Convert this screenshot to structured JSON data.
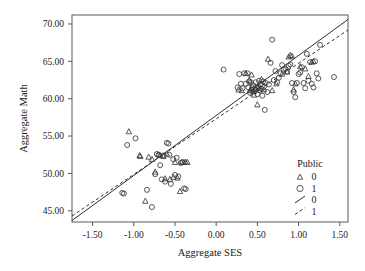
{
  "chart_data": {
    "type": "scatter",
    "title": "",
    "xlabel": "Aggregate SES",
    "ylabel": "Aggregate Math",
    "xlim": [
      -1.75,
      1.6
    ],
    "ylim": [
      43.5,
      71.2
    ],
    "xticks": [
      "-1.50",
      "-1.00",
      "-0.50",
      "0.00",
      "0.50",
      "1.00",
      "1.50"
    ],
    "xtick_values": [
      -1.5,
      -1.0,
      -0.5,
      0.0,
      0.5,
      1.0,
      1.5
    ],
    "yticks": [
      "45.00",
      "50.00",
      "55.00",
      "60.00",
      "65.00",
      "70.00"
    ],
    "ytick_values": [
      45,
      50,
      55,
      60,
      65,
      70
    ],
    "grid": false,
    "legend": {
      "title": "Public",
      "position": "inside-bottom-right",
      "entries": [
        {
          "marker": "triangle",
          "label": "0"
        },
        {
          "marker": "circle",
          "label": "1"
        },
        {
          "marker": "line-solid",
          "label": "0"
        },
        {
          "marker": "line-dashed",
          "label": "1"
        }
      ]
    },
    "series": [
      {
        "name": "Public = 0",
        "marker": "triangle",
        "points": [
          [
            -1.06,
            55.6
          ],
          [
            -0.93,
            52.4
          ],
          [
            -0.92,
            52.3
          ],
          [
            -0.86,
            46.3
          ],
          [
            -0.82,
            52.2
          ],
          [
            -0.78,
            51.9
          ],
          [
            -0.74,
            50.2
          ],
          [
            -0.7,
            52.5
          ],
          [
            -0.68,
            52.4
          ],
          [
            -0.64,
            52.3
          ],
          [
            -0.62,
            49.3
          ],
          [
            -0.6,
            52.6
          ],
          [
            -0.56,
            49.2
          ],
          [
            -0.52,
            49.5
          ],
          [
            -0.5,
            51.5
          ],
          [
            -0.47,
            49.4
          ],
          [
            -0.44,
            47.6
          ],
          [
            -0.42,
            51.5
          ],
          [
            -0.39,
            51.5
          ],
          [
            -0.37,
            51.5
          ],
          [
            -0.35,
            51.5
          ],
          [
            0.27,
            61.2
          ],
          [
            0.31,
            61.1
          ],
          [
            0.36,
            63.4
          ],
          [
            0.4,
            62.5
          ],
          [
            0.41,
            61.1
          ],
          [
            0.43,
            63.2
          ],
          [
            0.45,
            61.0
          ],
          [
            0.46,
            60.5
          ],
          [
            0.48,
            61.3
          ],
          [
            0.5,
            59.2
          ],
          [
            0.52,
            61.4
          ],
          [
            0.55,
            62.6
          ],
          [
            0.58,
            61.2
          ],
          [
            0.63,
            65.3
          ],
          [
            0.68,
            61.1
          ],
          [
            0.73,
            62.0
          ],
          [
            0.8,
            63.3
          ],
          [
            0.86,
            63.6
          ],
          [
            0.88,
            65.6
          ],
          [
            0.9,
            65.8
          ],
          [
            0.92,
            65.7
          ],
          [
            0.94,
            61.2
          ],
          [
            0.96,
            62.0
          ],
          [
            1.02,
            64.3
          ],
          [
            1.08,
            64.0
          ],
          [
            1.12,
            63.0
          ],
          [
            1.16,
            64.9
          ],
          [
            1.18,
            65.0
          ]
        ]
      },
      {
        "name": "Public = 1",
        "marker": "circle",
        "points": [
          [
            -1.14,
            47.4
          ],
          [
            -1.12,
            47.3
          ],
          [
            -1.08,
            53.8
          ],
          [
            -0.98,
            54.7
          ],
          [
            -0.84,
            47.8
          ],
          [
            -0.78,
            45.5
          ],
          [
            -0.74,
            49.9
          ],
          [
            -0.72,
            52.6
          ],
          [
            -0.7,
            52.5
          ],
          [
            -0.68,
            51.1
          ],
          [
            -0.66,
            49.2
          ],
          [
            -0.64,
            52.4
          ],
          [
            -0.62,
            48.9
          ],
          [
            -0.6,
            54.1
          ],
          [
            -0.58,
            54.0
          ],
          [
            -0.57,
            52.5
          ],
          [
            -0.55,
            48.6
          ],
          [
            -0.52,
            51.9
          ],
          [
            -0.5,
            49.8
          ],
          [
            -0.48,
            52.1
          ],
          [
            -0.46,
            49.6
          ],
          [
            -0.43,
            51.4
          ],
          [
            -0.41,
            51.5
          ],
          [
            -0.39,
            48.0
          ],
          [
            -0.37,
            47.9
          ],
          [
            0.09,
            63.9
          ],
          [
            0.26,
            61.5
          ],
          [
            0.28,
            63.3
          ],
          [
            0.3,
            62.0
          ],
          [
            0.32,
            61.4
          ],
          [
            0.34,
            63.4
          ],
          [
            0.36,
            62.0
          ],
          [
            0.38,
            63.4
          ],
          [
            0.39,
            61.5
          ],
          [
            0.4,
            62.3
          ],
          [
            0.41,
            60.8
          ],
          [
            0.42,
            62.2
          ],
          [
            0.43,
            61.2
          ],
          [
            0.44,
            61.5
          ],
          [
            0.45,
            61.8
          ],
          [
            0.46,
            61.3
          ],
          [
            0.47,
            61.0
          ],
          [
            0.48,
            62.2
          ],
          [
            0.49,
            61.4
          ],
          [
            0.5,
            60.6
          ],
          [
            0.51,
            61.6
          ],
          [
            0.52,
            62.4
          ],
          [
            0.53,
            61.1
          ],
          [
            0.54,
            61.9
          ],
          [
            0.55,
            61.3
          ],
          [
            0.56,
            60.4
          ],
          [
            0.57,
            62.3
          ],
          [
            0.58,
            61.6
          ],
          [
            0.59,
            58.5
          ],
          [
            0.6,
            62.1
          ],
          [
            0.62,
            60.9
          ],
          [
            0.64,
            61.9
          ],
          [
            0.66,
            64.8
          ],
          [
            0.68,
            67.9
          ],
          [
            0.7,
            62.5
          ],
          [
            0.72,
            63.7
          ],
          [
            0.74,
            62.2
          ],
          [
            0.76,
            62.8
          ],
          [
            0.78,
            63.4
          ],
          [
            0.8,
            64.5
          ],
          [
            0.82,
            63.9
          ],
          [
            0.84,
            64.0
          ],
          [
            0.86,
            63.6
          ],
          [
            0.88,
            64.4
          ],
          [
            0.9,
            64.6
          ],
          [
            0.92,
            62.1
          ],
          [
            0.94,
            60.9
          ],
          [
            0.96,
            60.2
          ],
          [
            0.98,
            62.1
          ],
          [
            1.0,
            63.3
          ],
          [
            1.02,
            63.5
          ],
          [
            1.04,
            64.2
          ],
          [
            1.06,
            62.1
          ],
          [
            1.08,
            61.4
          ],
          [
            1.1,
            66.0
          ],
          [
            1.12,
            62.4
          ],
          [
            1.14,
            64.9
          ],
          [
            1.16,
            62.0
          ],
          [
            1.18,
            61.5
          ],
          [
            1.2,
            65.0
          ],
          [
            1.22,
            63.4
          ],
          [
            1.24,
            62.7
          ],
          [
            1.26,
            67.2
          ],
          [
            1.43,
            62.9
          ]
        ]
      }
    ],
    "fit_lines": [
      {
        "name": "Public = 0",
        "style": "solid",
        "x0": -1.75,
        "y0": 43.7,
        "x1": 1.6,
        "ytip": 70.6
      },
      {
        "name": "Public = 1",
        "style": "dashed",
        "x0": -1.75,
        "y0": 44.3,
        "x1": 1.6,
        "ytip": 69.2
      }
    ]
  }
}
